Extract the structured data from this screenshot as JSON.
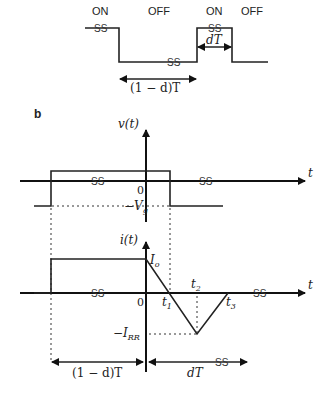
{
  "panel_a": {
    "state_labels": [
      "ON",
      "OFF",
      "ON",
      "OFF"
    ],
    "break_mark": "SS",
    "interval_off": "(1 − d)T",
    "interval_on": "dT"
  },
  "panel_b": {
    "label": "b",
    "voltage_plot": {
      "y_axis_label": "v(t)",
      "x_axis_label": "t",
      "origin_label": "0",
      "level_label": "−V",
      "level_sub": "g",
      "break_mark": "SS"
    },
    "current_plot": {
      "y_axis_label": "i(t)",
      "x_axis_label": "t",
      "origin_label": "0",
      "peak_label": "I",
      "peak_sub": "o",
      "reverse_label": "−I",
      "reverse_sub": "RR",
      "time_marks": [
        {
          "label": "t",
          "sub": "1"
        },
        {
          "label": "t",
          "sub": "2"
        },
        {
          "label": "t",
          "sub": "3"
        }
      ],
      "break_mark": "SS"
    },
    "intervals": {
      "left": "(1 − d)T",
      "right": "dT",
      "break_mark": "SS"
    }
  }
}
